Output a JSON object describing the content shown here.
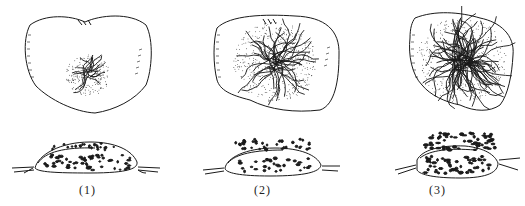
{
  "figure": {
    "panels": [
      {
        "id": 1,
        "caption": "(1)",
        "stage": "small central lesion"
      },
      {
        "id": 2,
        "caption": "(2)",
        "stage": "spreading lesion"
      },
      {
        "id": 3,
        "caption": "(3)",
        "stage": "extensive lesion"
      }
    ],
    "colors": {
      "ink": "#1a1a1a",
      "background": "#ffffff"
    }
  }
}
